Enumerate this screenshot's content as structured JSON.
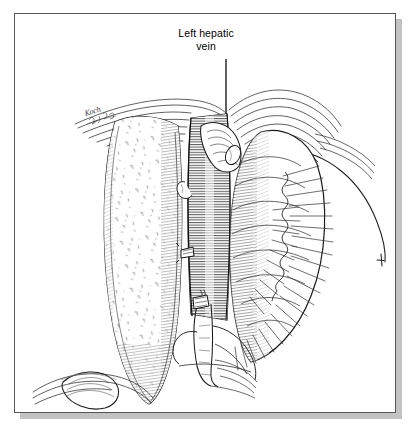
{
  "figure": {
    "kind": "anatomical-line-illustration",
    "ink_color": "#1a1a1a",
    "paper_color": "#ffffff",
    "frame_color": "#555555",
    "shadow_color": "#b9b9b9",
    "artist_signature": "Koch"
  },
  "labels": [
    {
      "id": "left-hepatic-vein",
      "text": "Left hepatic\nvein",
      "line1": "Left hepatic",
      "line2": "vein",
      "leader": {
        "x1": 211,
        "y1": 45,
        "x2": 211,
        "y2": 107
      }
    }
  ],
  "structures": [
    {
      "name": "left-hepatic-lobe",
      "note": "stippled parenchyma, left of midline"
    },
    {
      "name": "inferior-vena-cava",
      "note": "central vertical tube, dense horizontal hatching"
    },
    {
      "name": "left-hepatic-vein-stump",
      "note": "branch entering cava at upper left"
    },
    {
      "name": "right-hepatic-lobe",
      "note": "large rounded mass to the right"
    },
    {
      "name": "diaphragm-edge",
      "note": "long thin curved line sweeping to the right margin"
    },
    {
      "name": "falciform-ligament",
      "note": "tissue folds across the top"
    },
    {
      "name": "portal-structures",
      "note": "branching vessels at the hilum, lower centre"
    },
    {
      "name": "gallbladder-fundus",
      "note": "small dome at lower left"
    },
    {
      "name": "fringed-serosal-edge",
      "note": "radiating fan hatching along the right border"
    }
  ],
  "canvas": {
    "width": 382,
    "height": 400
  }
}
